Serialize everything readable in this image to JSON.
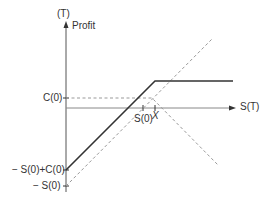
{
  "diagram": {
    "y_axis": {
      "top_label": "(T)",
      "label": "Profit"
    },
    "x_axis": {
      "label": "S(T)"
    },
    "y_ticks": [
      {
        "label": "C(0)",
        "y": 98
      },
      {
        "label": "− S(0)+C(0)",
        "y": 170
      },
      {
        "label": "− S(0)",
        "y": 186
      }
    ],
    "x_ticks": [
      {
        "label": "S(0)",
        "x": 143
      },
      {
        "label": "X",
        "x": 155
      }
    ],
    "lines": [
      {
        "name": "covered-call-profit",
        "style": "solid",
        "points": [
          [
            66,
            170
          ],
          [
            155,
            81
          ],
          [
            233,
            81
          ]
        ]
      },
      {
        "name": "long-stock-profit",
        "style": "dashed",
        "points": [
          [
            66,
            186
          ],
          [
            213,
            38
          ]
        ]
      },
      {
        "name": "short-call-profit",
        "style": "dashed",
        "points": [
          [
            66,
            98
          ],
          [
            152,
            98
          ],
          [
            218,
            165
          ]
        ]
      }
    ],
    "colors": {
      "axis": "#555555",
      "solid": "#333333",
      "dashed": "#999999"
    }
  }
}
